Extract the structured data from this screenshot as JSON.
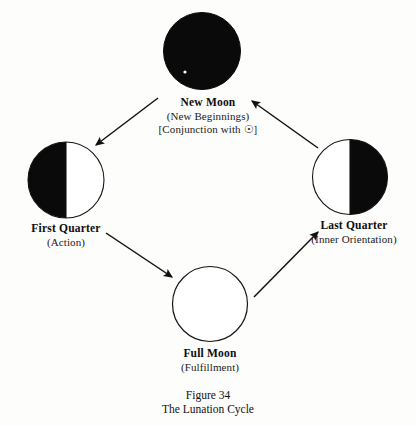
{
  "figure": {
    "caption_number": "Figure 34",
    "caption_title": "The Lunation Cycle",
    "background_color": "#fdfdfc",
    "ink_color": "#111111"
  },
  "diagram": {
    "type": "cycle",
    "direction": "clockwise",
    "nodes": [
      {
        "id": "new-moon",
        "title": "New Moon",
        "subtitle": "(New Beginnings)",
        "extra": "[Conjunction with ☉]",
        "phase": "new",
        "fill": "#0a0a0a",
        "position": "top",
        "cx": 202,
        "cy": 51,
        "r": 38
      },
      {
        "id": "first-quarter",
        "title": "First Quarter",
        "subtitle": "(Action)",
        "extra": "",
        "phase": "left-half-dark",
        "fill": "#0a0a0a",
        "position": "left",
        "cx": 66,
        "cy": 179,
        "r": 38
      },
      {
        "id": "full-moon",
        "title": "Full Moon",
        "subtitle": "(Fulfillment)",
        "extra": "",
        "phase": "full-light",
        "fill": "#ffffff",
        "position": "bottom",
        "cx": 210,
        "cy": 304,
        "r": 38
      },
      {
        "id": "last-quarter",
        "title": "Last Quarter",
        "subtitle": "(Inner Orientation)",
        "extra": "",
        "phase": "right-half-dark",
        "fill": "#0a0a0a",
        "position": "right",
        "cx": 350,
        "cy": 176,
        "r": 38
      }
    ],
    "arrows": [
      {
        "id": "arrow-new-to-first",
        "from": "new-moon",
        "to": "first-quarter"
      },
      {
        "id": "arrow-first-to-full",
        "from": "first-quarter",
        "to": "full-moon"
      },
      {
        "id": "arrow-full-to-last",
        "from": "full-moon",
        "to": "last-quarter"
      },
      {
        "id": "arrow-last-to-new",
        "from": "last-quarter",
        "to": "new-moon"
      }
    ],
    "symbols": {
      "sun": "☉",
      "sun_name": "sun-symbol"
    }
  }
}
